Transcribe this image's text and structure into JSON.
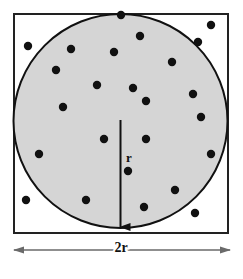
{
  "figure": {
    "labels": {
      "radius": "r",
      "side": "2r"
    },
    "colors": {
      "circle_fill": "#d5d5d5",
      "circle_stroke": "#111111",
      "square_fill": "#ffffff",
      "square_stroke": "#222222",
      "point_color": "#111111",
      "arrow_color": "#111111",
      "dimension_color": "#666666",
      "background": "#ffffff"
    }
  },
  "chart_data": {
    "type": "scatter",
    "title": "",
    "subtitle": "",
    "xlabel": "",
    "ylabel": "",
    "xlim": [
      0,
      243
    ],
    "ylim": [
      0,
      279
    ],
    "grid": false,
    "legend": null,
    "annotations": [
      {
        "name": "radius-label",
        "text": "r",
        "x": 127,
        "y": 158
      },
      {
        "name": "side-dimension-label",
        "text": "2r",
        "x": 121,
        "y": 250
      }
    ],
    "shapes": {
      "square": {
        "name": "bounding-square",
        "x": 13,
        "y": 13,
        "width": 215,
        "height": 220,
        "side_label": "2r",
        "fill": "#ffffff",
        "stroke": "#222222",
        "stroke_width": 2
      },
      "circle": {
        "name": "inscribed-circle",
        "cx": 120.5,
        "cy": 121,
        "r": 107.5,
        "fill": "#d5d5d5",
        "stroke": "#111111",
        "stroke_width": 2
      },
      "radius_arrow": {
        "name": "radius-arrow",
        "x1": 120.5,
        "y1": 120,
        "x2": 120.5,
        "y2": 229,
        "label": "r"
      },
      "dimension_arrow": {
        "name": "width-dimension-arrow",
        "x1": 13,
        "y1": 250,
        "x2": 230,
        "y2": 250,
        "label": "2r",
        "double_headed": true
      }
    },
    "point_radius": 4.2,
    "points_total": 25,
    "points_inside_circle": 20,
    "points_outside_circle": 5,
    "points": [
      {
        "x": 211,
        "y": 25,
        "inside": false
      },
      {
        "x": 140,
        "y": 36,
        "inside": true
      },
      {
        "x": 198,
        "y": 42,
        "inside": false
      },
      {
        "x": 28,
        "y": 46,
        "inside": false
      },
      {
        "x": 71,
        "y": 49,
        "inside": true
      },
      {
        "x": 114,
        "y": 52,
        "inside": true
      },
      {
        "x": 172,
        "y": 62,
        "inside": true
      },
      {
        "x": 97,
        "y": 85,
        "inside": true
      },
      {
        "x": 133,
        "y": 88,
        "inside": true
      },
      {
        "x": 193,
        "y": 94,
        "inside": true
      },
      {
        "x": 146,
        "y": 101,
        "inside": true
      },
      {
        "x": 63,
        "y": 107,
        "inside": true
      },
      {
        "x": 201,
        "y": 117,
        "inside": true
      },
      {
        "x": 104,
        "y": 139,
        "inside": true
      },
      {
        "x": 146,
        "y": 139,
        "inside": true
      },
      {
        "x": 39,
        "y": 154,
        "inside": true
      },
      {
        "x": 211,
        "y": 154,
        "inside": true
      },
      {
        "x": 128,
        "y": 171,
        "inside": true
      },
      {
        "x": 175,
        "y": 190,
        "inside": true
      },
      {
        "x": 26,
        "y": 200,
        "inside": false
      },
      {
        "x": 86,
        "y": 200,
        "inside": true
      },
      {
        "x": 144,
        "y": 207,
        "inside": true
      },
      {
        "x": 195,
        "y": 213,
        "inside": false
      },
      {
        "x": 121,
        "y": 15,
        "inside": true
      },
      {
        "x": 56,
        "y": 70,
        "inside": true
      }
    ]
  }
}
